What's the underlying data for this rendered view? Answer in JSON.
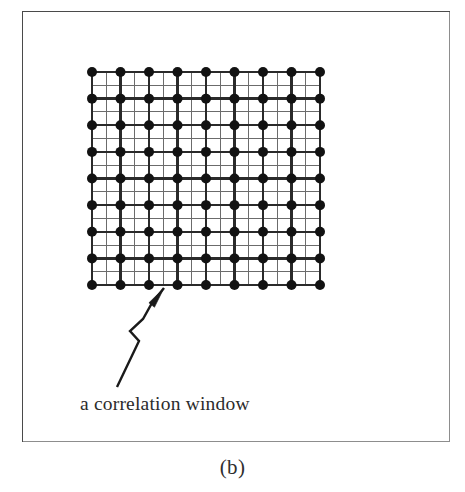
{
  "figure": {
    "subfigure_label": "(b)",
    "background_color": "#ffffff",
    "frame_color": "#4a4a4a",
    "frame": {
      "x": 22,
      "y": 11,
      "width": 428,
      "height": 431
    }
  },
  "annotation": {
    "caption": "a correlation window",
    "caption_color": "#2b2b2b",
    "leader_line": {
      "type": "zigzag-arrow",
      "color": "#1a1a1a",
      "tip": {
        "x": 164,
        "y": 287
      },
      "tail": {
        "x": 117,
        "y": 387
      },
      "points": "117,387 139,341 130,331 143,319 152,303 164,288"
    }
  },
  "chart_data": {
    "type": "scatter",
    "title": "",
    "subtitle": "",
    "xlabel": "",
    "ylabel": "",
    "grid": true,
    "legend_position": "none",
    "marker": {
      "shape": "filled-circle",
      "color": "#121212",
      "diameter_px": 10
    },
    "grid_lines": {
      "major_color": "#2a2a2a",
      "major_width_px": 2.3,
      "minor_color": "#6b6b6b",
      "minor_width_px": 1,
      "minor_per_major": 1
    },
    "node_rows": 9,
    "node_cols": 9,
    "bounds_px": {
      "x0": 92,
      "y0": 72,
      "x1": 320,
      "y1": 285
    },
    "x_spacing_px": 28.5,
    "y_spacing_px": 26.625,
    "x": [
      0,
      1,
      2,
      3,
      4,
      5,
      6,
      7,
      8
    ],
    "y": [
      0,
      1,
      2,
      3,
      4,
      5,
      6,
      7,
      8
    ],
    "xlim": [
      0,
      8
    ],
    "ylim": [
      0,
      8
    ],
    "values": [
      [
        1,
        1,
        1,
        1,
        1,
        1,
        1,
        1,
        1
      ],
      [
        1,
        1,
        1,
        1,
        1,
        1,
        1,
        1,
        1
      ],
      [
        1,
        1,
        1,
        1,
        1,
        1,
        1,
        1,
        1
      ],
      [
        1,
        1,
        1,
        1,
        1,
        1,
        1,
        1,
        1
      ],
      [
        1,
        1,
        1,
        1,
        1,
        1,
        1,
        1,
        1
      ],
      [
        1,
        1,
        1,
        1,
        1,
        1,
        1,
        1,
        1
      ],
      [
        1,
        1,
        1,
        1,
        1,
        1,
        1,
        1,
        1
      ],
      [
        1,
        1,
        1,
        1,
        1,
        1,
        1,
        1,
        1
      ],
      [
        1,
        1,
        1,
        1,
        1,
        1,
        1,
        1,
        1
      ]
    ],
    "annotations": [
      {
        "text": "a correlation window",
        "target_x": 2.5,
        "target_y": 0
      }
    ]
  }
}
